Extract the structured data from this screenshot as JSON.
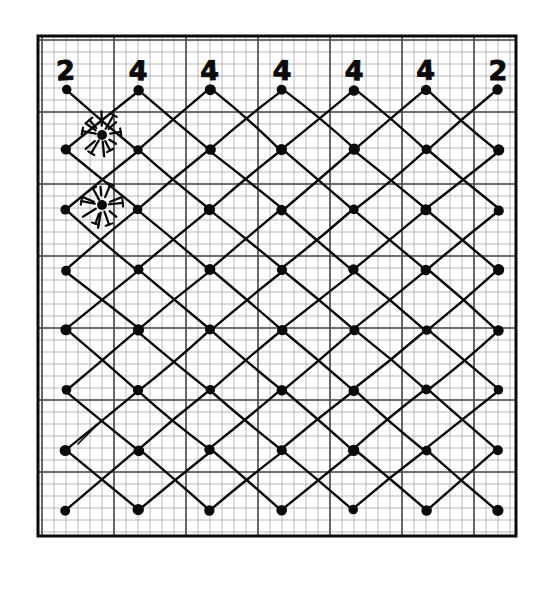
{
  "figure": {
    "kind": "hand-drawn-lattice-diagram",
    "background_color": "#ffffff",
    "ink_color": "#0a0a0a",
    "grid_color": "#4a4a4a",
    "fine_grid_color": "#8f8f8f",
    "canvas": {
      "width": 545,
      "height": 590
    }
  },
  "frame": {
    "x": 38,
    "y": 36,
    "width": 478,
    "height": 500,
    "stroke_width": 3
  },
  "paper_grid": {
    "fine_cell": 12.0,
    "heavy_every": 6,
    "origin_x": 42,
    "origin_y": 40,
    "cols": 39,
    "rows": 41,
    "fine_stroke": 0.6,
    "heavy_stroke": 1.6
  },
  "lattice": {
    "description": "Square lattice rotated 45 degrees; nodes on alternating (col+row even) positions",
    "node_spacing_x": 72,
    "node_spacing_y": 60,
    "origin_x": 66,
    "origin_y": 90,
    "cols": 7,
    "rows": 8,
    "node_radius": 5.2,
    "edge_stroke": 2.4,
    "nodes": [
      {
        "c": 0,
        "r": 0
      },
      {
        "c": 1,
        "r": 0
      },
      {
        "c": 2,
        "r": 0
      },
      {
        "c": 3,
        "r": 0
      },
      {
        "c": 4,
        "r": 0
      },
      {
        "c": 5,
        "r": 0
      },
      {
        "c": 6,
        "r": 0
      },
      {
        "c": 0,
        "r": 1
      },
      {
        "c": 1,
        "r": 1
      },
      {
        "c": 2,
        "r": 1
      },
      {
        "c": 3,
        "r": 1
      },
      {
        "c": 4,
        "r": 1
      },
      {
        "c": 5,
        "r": 1
      },
      {
        "c": 6,
        "r": 1
      },
      {
        "c": 0,
        "r": 2
      },
      {
        "c": 1,
        "r": 2
      },
      {
        "c": 2,
        "r": 2
      },
      {
        "c": 3,
        "r": 2
      },
      {
        "c": 4,
        "r": 2
      },
      {
        "c": 5,
        "r": 2
      },
      {
        "c": 6,
        "r": 2
      },
      {
        "c": 0,
        "r": 3
      },
      {
        "c": 1,
        "r": 3
      },
      {
        "c": 2,
        "r": 3
      },
      {
        "c": 3,
        "r": 3
      },
      {
        "c": 4,
        "r": 3
      },
      {
        "c": 5,
        "r": 3
      },
      {
        "c": 6,
        "r": 3
      },
      {
        "c": 0,
        "r": 4
      },
      {
        "c": 1,
        "r": 4
      },
      {
        "c": 2,
        "r": 4
      },
      {
        "c": 3,
        "r": 4
      },
      {
        "c": 4,
        "r": 4
      },
      {
        "c": 5,
        "r": 4
      },
      {
        "c": 6,
        "r": 4
      },
      {
        "c": 0,
        "r": 5
      },
      {
        "c": 1,
        "r": 5
      },
      {
        "c": 2,
        "r": 5
      },
      {
        "c": 3,
        "r": 5
      },
      {
        "c": 4,
        "r": 5
      },
      {
        "c": 5,
        "r": 5
      },
      {
        "c": 6,
        "r": 5
      },
      {
        "c": 0,
        "r": 6
      },
      {
        "c": 1,
        "r": 6
      },
      {
        "c": 2,
        "r": 6
      },
      {
        "c": 3,
        "r": 6
      },
      {
        "c": 4,
        "r": 6
      },
      {
        "c": 5,
        "r": 6
      },
      {
        "c": 6,
        "r": 6
      },
      {
        "c": 0,
        "r": 7
      },
      {
        "c": 1,
        "r": 7
      },
      {
        "c": 2,
        "r": 7
      },
      {
        "c": 3,
        "r": 7
      },
      {
        "c": 4,
        "r": 7
      },
      {
        "c": 5,
        "r": 7
      },
      {
        "c": 6,
        "r": 7
      }
    ]
  },
  "degree_labels": {
    "values": [
      "2",
      "4",
      "4",
      "4",
      "4",
      "4",
      "2"
    ],
    "y": 80,
    "columns": [
      66,
      138,
      210,
      282,
      354,
      426,
      498
    ]
  },
  "starbursts": [
    {
      "id": "starburst-upper",
      "x": 102,
      "y": 135,
      "rays": 12,
      "radius": 20
    },
    {
      "id": "starburst-lower",
      "x": 102,
      "y": 205,
      "rays": 12,
      "radius": 20
    }
  ],
  "stray_marks": [
    {
      "id": "stray-stroke-lower-left",
      "x1": 78,
      "y1": 444,
      "x2": 98,
      "y2": 424
    }
  ]
}
